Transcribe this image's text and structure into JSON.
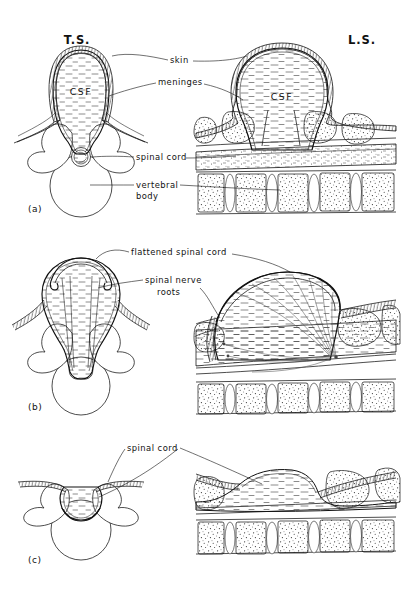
{
  "figure": {
    "background_color": "#ffffff",
    "ink_color": "#111111",
    "headers": {
      "ts": "T.S.",
      "ls": "L.S."
    },
    "panels": [
      {
        "id": "a",
        "marker": "(a)",
        "labels": [
          {
            "name": "skin",
            "text": "skin"
          },
          {
            "name": "meninges",
            "text": "meninges"
          },
          {
            "name": "spinal-cord",
            "text": "spinal cord"
          },
          {
            "name": "vertebral-body",
            "text": "vertebral",
            "text2": "body"
          }
        ],
        "inline_labels": [
          {
            "name": "csf-ts",
            "text": "CSF"
          },
          {
            "name": "csf-ls",
            "text": "CSF"
          }
        ]
      },
      {
        "id": "b",
        "marker": "(b)",
        "labels": [
          {
            "name": "flattened-spinal-cord",
            "text": "flattened spinal cord"
          },
          {
            "name": "spinal-nerve-roots",
            "text": "spinal nerve",
            "text2": "roots"
          }
        ],
        "inline_labels": []
      },
      {
        "id": "c",
        "marker": "(c)",
        "labels": [
          {
            "name": "spinal-cord",
            "text": "spinal  cord"
          }
        ],
        "inline_labels": []
      }
    ]
  }
}
